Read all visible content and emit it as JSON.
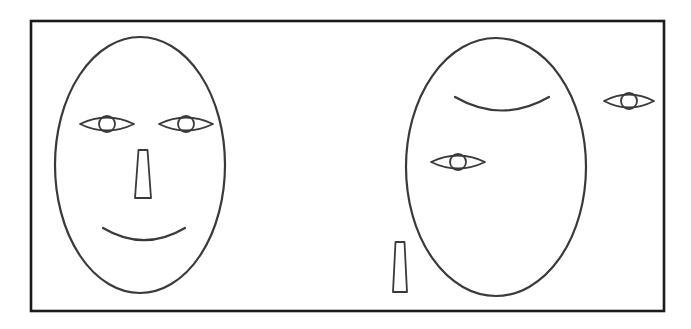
{
  "figure": {
    "background_color": "#ffffff",
    "frame": {
      "name": "outer border rectangle",
      "stroke_color": "#1b1b1b",
      "x": 31,
      "y": 21,
      "width": 633,
      "height": 290
    },
    "stroke_color": "#3a3a3a",
    "faces": [
      {
        "id": "left-face",
        "label": "normal face",
        "head": {
          "cx": 140,
          "cy": 165,
          "rx": 85,
          "ry": 128,
          "stroke_width": 2.2
        },
        "parts": [
          {
            "type": "eye",
            "name": "left-eye",
            "cx": 107,
            "cy": 124,
            "rx": 27,
            "ry": 9,
            "iris_r": 8,
            "stroke_width": 1.8
          },
          {
            "type": "eye",
            "name": "right-eye",
            "cx": 186,
            "cy": 124,
            "rx": 27,
            "ry": 9,
            "iris_r": 8,
            "stroke_width": 1.8
          },
          {
            "type": "nose",
            "name": "nose",
            "top_x": 143,
            "top_y": 150,
            "top_w": 9,
            "bottom_w": 16,
            "height": 48,
            "stroke_width": 1.8
          },
          {
            "type": "mouth",
            "name": "mouth",
            "x1": 103,
            "y1": 228,
            "x2": 185,
            "y2": 228,
            "depth": 18,
            "stroke_width": 2.2
          }
        ]
      },
      {
        "id": "right-face",
        "label": "scrambled face",
        "head": {
          "cx": 496,
          "cy": 167,
          "rx": 90,
          "ry": 129,
          "stroke_width": 2.2
        },
        "parts": [
          {
            "type": "mouth",
            "name": "displaced-mouth-on-forehead",
            "x1": 455,
            "y1": 97,
            "x2": 549,
            "y2": 97,
            "depth": 20,
            "stroke_width": 2.2
          },
          {
            "type": "eye",
            "name": "displaced-eye-midface",
            "cx": 458,
            "cy": 162,
            "rx": 27,
            "ry": 9,
            "iris_r": 8,
            "stroke_width": 1.8
          },
          {
            "type": "eye",
            "name": "detached-eye-outside-right",
            "cx": 629,
            "cy": 101,
            "rx": 25,
            "ry": 9,
            "iris_r": 8,
            "stroke_width": 1.8
          },
          {
            "type": "nose",
            "name": "detached-nose-outside-lower-left",
            "top_x": 400,
            "top_y": 242,
            "top_w": 9,
            "bottom_w": 14,
            "height": 50,
            "stroke_width": 1.8
          }
        ]
      }
    ]
  }
}
